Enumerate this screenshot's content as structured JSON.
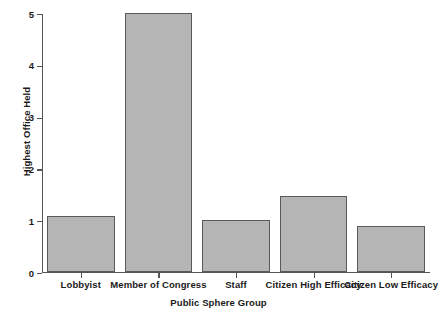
{
  "chart_data": {
    "type": "bar",
    "title": "",
    "xlabel": "Public Sphere Group",
    "ylabel": "Highest Office Held",
    "categories": [
      "Lobbyist",
      "Member of Congress",
      "Staff",
      "Citizen High Efficacy",
      "Citizen Low Efficacy"
    ],
    "values": [
      1.08,
      5.0,
      1.0,
      1.46,
      0.88
    ],
    "ylim": [
      0,
      5
    ],
    "yticks": [
      0,
      1,
      2,
      3,
      4,
      5
    ],
    "ytick_labels": [
      "0",
      "1",
      "2",
      "3",
      "4",
      "5"
    ],
    "grid": false,
    "legend": null,
    "bar_color": "#b5b5b5",
    "bar_edge_color": "#5a5a5a",
    "axis_color": "#555555",
    "background": "#ffffff"
  }
}
